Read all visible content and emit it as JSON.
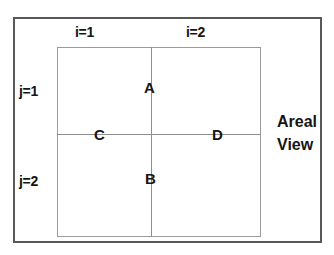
{
  "diagram": {
    "kind": "grid-schematic",
    "caption": {
      "line1": "Areal",
      "line2": "View"
    },
    "column_labels": [
      {
        "id": "i1",
        "text": "i=1"
      },
      {
        "id": "i2",
        "text": "i=2"
      }
    ],
    "row_labels": [
      {
        "id": "j1",
        "text": "j=1"
      },
      {
        "id": "j2",
        "text": "j=2"
      }
    ],
    "point_labels": [
      {
        "id": "a",
        "text": "A"
      },
      {
        "id": "b",
        "text": "B"
      },
      {
        "id": "c",
        "text": "C"
      },
      {
        "id": "d",
        "text": "D"
      }
    ],
    "colors": {
      "background": "#ffffff",
      "outer_border": "#58585a",
      "inner_border": "#9a9a9c",
      "grid_line": "#8e8e90",
      "text": "#151515"
    }
  }
}
